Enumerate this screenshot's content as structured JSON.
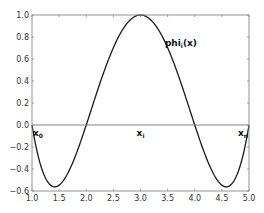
{
  "chart_data": {
    "type": "line",
    "title": "",
    "xlabel": "",
    "ylabel": "",
    "xlim": [
      1.0,
      5.0
    ],
    "ylim": [
      -0.6,
      1.0
    ],
    "grid": false,
    "x_ticks": [
      "1.0",
      "1.5",
      "2.0",
      "2.5",
      "3.0",
      "3.5",
      "4.0",
      "4.5",
      "5.0"
    ],
    "y_ticks": [
      "1.0",
      "0.8",
      "0.6",
      "0.4",
      "0.2",
      "0.0",
      "-0.2",
      "-0.4",
      "-0.6"
    ],
    "series": [
      {
        "name": "phi_i(x)",
        "formula": "(x-1)(x-2)(x-4)(x-5)/4",
        "x": [
          1.0,
          1.25,
          1.42,
          1.5,
          1.75,
          2.0,
          2.25,
          2.5,
          2.75,
          3.0,
          3.25,
          3.5,
          3.75,
          4.0,
          4.25,
          4.5,
          4.58,
          4.75,
          5.0
        ],
        "values": [
          0.0,
          -0.48,
          -0.56,
          -0.55,
          -0.42,
          0.0,
          0.32,
          0.7,
          0.92,
          1.0,
          0.92,
          0.7,
          0.32,
          0.0,
          -0.42,
          -0.55,
          -0.56,
          -0.48,
          0.0
        ]
      }
    ],
    "annotations": [
      {
        "text": "phi",
        "sub": "i",
        "suffix": "(x)",
        "x": 3.45,
        "y": 0.72
      },
      {
        "text": "x",
        "sub": "0",
        "x": 1.0,
        "y": -0.03
      },
      {
        "text": "x",
        "sub": "i",
        "x": 3.0,
        "y": -0.03
      },
      {
        "text": "x",
        "sub": "n",
        "x": 5.0,
        "y": -0.03
      }
    ],
    "reference_lines": [
      {
        "orientation": "horizontal",
        "y": 0.0
      }
    ]
  }
}
